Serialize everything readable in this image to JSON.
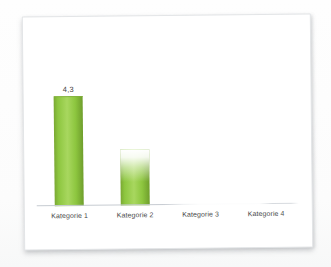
{
  "chart_data": {
    "type": "bar",
    "title": "",
    "xlabel": "",
    "ylabel": "",
    "categories": [
      "Kategorie 1",
      "Kategorie 2",
      "Kategorie 3",
      "Kategorie 4"
    ],
    "values": [
      4.3,
      2.2,
      0,
      0
    ],
    "data_labels": [
      "4,3",
      "",
      "",
      ""
    ],
    "ylim": [
      0,
      5
    ],
    "grid": false,
    "legend": false,
    "value_axis_visible": false,
    "fade_top_flags": [
      false,
      true,
      false,
      false
    ],
    "colors": {
      "bar_light": "#a8d75f",
      "bar_mid": "#8dc63f",
      "bar_dark": "#6f9e2c",
      "bar_edge": "#7aa833",
      "axis_line": "#c6cbd1",
      "label": "#474747",
      "paper_border": "#e3e5e7",
      "page_bg": "#fdfdfd"
    }
  }
}
